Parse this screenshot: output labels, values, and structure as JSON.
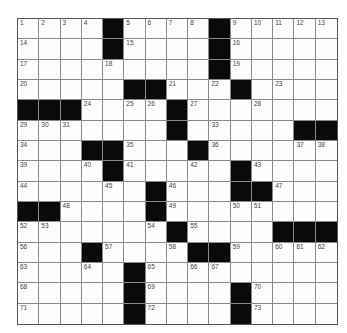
{
  "puzzle": {
    "size": 15,
    "colors": {
      "black": "#0a0a0a",
      "white": "#fdfdfd",
      "line": "#8a8a8a",
      "number": "#444444"
    },
    "grid": [
      "....#....#.....",
      "....#....#.....",
      ".........#.....",
      ".....##...#....",
      "###....#.......",
      ".......#.....##",
      "...##...#......",
      "....#.....#....",
      "......#...##...",
      "##....#........",
      ".......#....###",
      "...#....##.....",
      ".....#.........",
      ".....#....#....",
      ".....#....#...."
    ],
    "numbers": [
      [
        "1",
        "2",
        "3",
        "4",
        "",
        "5",
        "6",
        "7",
        "8",
        "",
        "9",
        "10",
        "11",
        "12",
        "13"
      ],
      [
        "14",
        "",
        "",
        "",
        "",
        "15",
        "",
        "",
        "",
        "",
        "16",
        "",
        "",
        "",
        ""
      ],
      [
        "17",
        "",
        "",
        "",
        "18",
        "",
        "",
        "",
        "",
        "",
        "19",
        "",
        "",
        "",
        ""
      ],
      [
        "20",
        "",
        "",
        "",
        "",
        "",
        "",
        "21",
        "",
        "22",
        "",
        "",
        "23",
        "",
        ""
      ],
      [
        "",
        "",
        "",
        "24",
        "",
        "25",
        "26",
        "",
        "27",
        "",
        "",
        "28",
        "",
        "",
        ""
      ],
      [
        "29",
        "30",
        "31",
        "",
        "",
        "",
        "",
        "32",
        "",
        "33",
        "",
        "",
        "",
        "",
        ""
      ],
      [
        "34",
        "",
        "",
        "",
        "",
        "35",
        "",
        "",
        "",
        "36",
        "",
        "",
        "",
        "37",
        "38"
      ],
      [
        "39",
        "",
        "",
        "40",
        "",
        "41",
        "",
        "",
        "42",
        "",
        "",
        "43",
        "",
        "",
        ""
      ],
      [
        "44",
        "",
        "",
        "",
        "45",
        "",
        "",
        "46",
        "",
        "",
        "",
        "",
        "47",
        "",
        ""
      ],
      [
        "",
        "",
        "48",
        "",
        "",
        "",
        "",
        "49",
        "",
        "",
        "50",
        "51",
        "",
        "",
        ""
      ],
      [
        "52",
        "53",
        "",
        "",
        "",
        "",
        "54",
        "",
        "55",
        "",
        "",
        "",
        "",
        "",
        ""
      ],
      [
        "56",
        "",
        "",
        "",
        "57",
        "",
        "",
        "58",
        "",
        "",
        "59",
        "",
        "60",
        "61",
        "62"
      ],
      [
        "63",
        "",
        "",
        "64",
        "",
        "",
        "65",
        "",
        "66",
        "67",
        "",
        "",
        "",
        "",
        ""
      ],
      [
        "68",
        "",
        "",
        "",
        "",
        "",
        "69",
        "",
        "",
        "",
        "",
        "70",
        "",
        "",
        ""
      ],
      [
        "71",
        "",
        "",
        "",
        "",
        "",
        "72",
        "",
        "",
        "",
        "",
        "73",
        "",
        "",
        ""
      ]
    ]
  }
}
